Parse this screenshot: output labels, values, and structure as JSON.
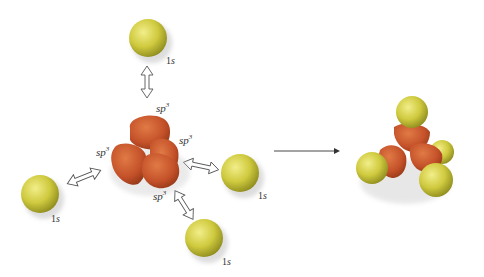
{
  "diagram": {
    "labels": {
      "hybrid_base": "sp",
      "hybrid_sup": "3",
      "s_num": "1",
      "s_letter": "s"
    },
    "colors": {
      "s_orbital": "#c9c63a",
      "sp3_orbital": "#c8552a",
      "arrow_stroke": "#555555"
    },
    "nodes": [
      {
        "id": "top-1s",
        "label": "1s"
      },
      {
        "id": "left-1s",
        "label": "1s"
      },
      {
        "id": "right-1s",
        "label": "1s"
      },
      {
        "id": "bottom-1s",
        "label": "1s"
      },
      {
        "id": "sp3-center",
        "label": "sp3 x4"
      },
      {
        "id": "methane-product",
        "label": ""
      }
    ],
    "reaction_arrow": "→"
  }
}
